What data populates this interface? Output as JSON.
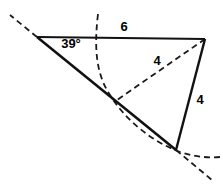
{
  "figure": {
    "background_color": "#ffffff",
    "stroke_color": "#111111",
    "dash_color": "#1a1a1a",
    "width": 223,
    "height": 192,
    "labels": {
      "angle": "39°",
      "top_side": "6",
      "dashed_side": "4",
      "right_side": "4"
    },
    "label_positions": {
      "angle": {
        "x": 71,
        "y": 45,
        "size": 13
      },
      "top_side": {
        "x": 124,
        "y": 28,
        "size": 13
      },
      "dashed_side": {
        "x": 157,
        "y": 62,
        "size": 13
      },
      "right_side": {
        "x": 200,
        "y": 101,
        "size": 13
      }
    },
    "vertices": {
      "apex_left": {
        "x": 37,
        "y": 37,
        "name": "A"
      },
      "top_right": {
        "x": 205,
        "y": 39,
        "name": "B"
      },
      "bottom_right": {
        "x": 176,
        "y": 150,
        "name": "C"
      },
      "mid_intersection": {
        "x": 117,
        "y": 100,
        "name": "C-prime"
      }
    },
    "solid_segments": [
      {
        "name": "top-side-segment",
        "x1": 37,
        "y1": 37,
        "x2": 205,
        "y2": 39,
        "width": 2.2
      },
      {
        "name": "left-ray-segment",
        "x1": 37,
        "y1": 37,
        "x2": 176,
        "y2": 150,
        "width": 2.6
      },
      {
        "name": "right-side-segment",
        "x1": 205,
        "y1": 39,
        "x2": 176,
        "y2": 150,
        "width": 2.4
      }
    ],
    "dashed_segments": [
      {
        "name": "ray-extension-upper-left",
        "x1": 37,
        "y1": 37,
        "x2": 10,
        "y2": 15,
        "width": 1.8,
        "dash": "6,4"
      },
      {
        "name": "ray-extension-lower-right",
        "x1": 176,
        "y1": 150,
        "x2": 212,
        "y2": 180,
        "width": 1.8,
        "dash": "6,4"
      },
      {
        "name": "alt-triangle-side",
        "x1": 205,
        "y1": 39,
        "x2": 117,
        "y2": 100,
        "width": 1.8,
        "dash": "6,4"
      }
    ],
    "dashed_arc": {
      "name": "compass-arc-radius-4",
      "center_x": 205,
      "center_y": 39,
      "radius": 107,
      "start_x": 98,
      "start_y": 14,
      "path": "M 98,14 C 94,48 96,74 110,95 C 124,118 150,141 180,152 C 196,157 208,158 220,157",
      "width": 1.8,
      "dash": "6,4"
    }
  }
}
